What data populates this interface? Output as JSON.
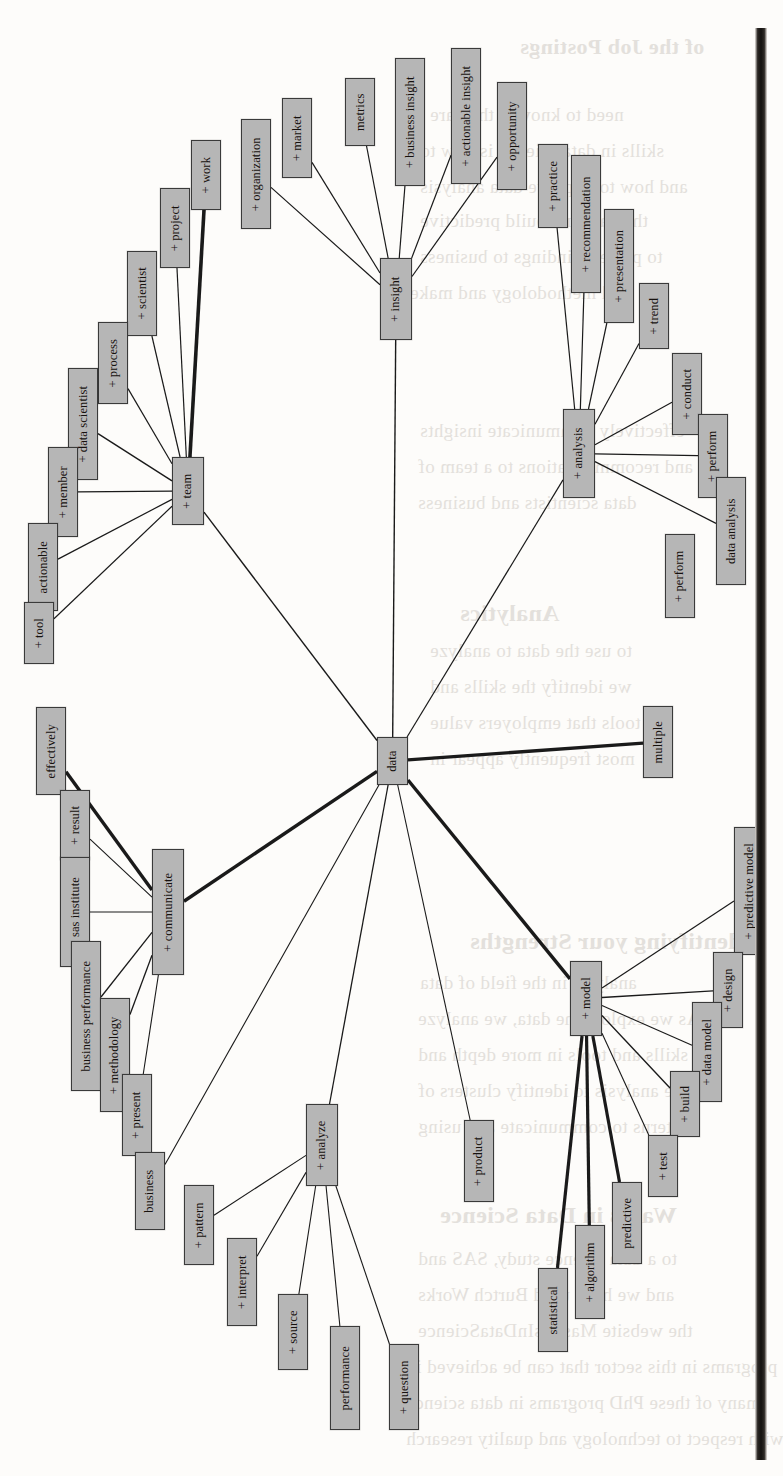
{
  "figure": {
    "type": "word-network-graph",
    "orientation": "rotated-90-ccw",
    "center_node": "data",
    "node_fill": "#b6b6b6",
    "node_stroke": "#3a3a3a",
    "edge_color": "#1a1a1a",
    "page_background": "#fdfcfa",
    "gutter_color": "#141210"
  },
  "nodes": [
    {
      "id": "data",
      "label": "data",
      "x": 377,
      "y": 737,
      "w": 31,
      "h": 48,
      "hub": true
    },
    {
      "id": "team",
      "label": "+ team",
      "x": 172,
      "y": 457,
      "w": 32,
      "h": 68,
      "hub": true
    },
    {
      "id": "insight",
      "label": "+ insight",
      "x": 380,
      "y": 258,
      "w": 32,
      "h": 82,
      "hub": true
    },
    {
      "id": "analysis",
      "label": "+ analysis",
      "x": 563,
      "y": 409,
      "w": 32,
      "h": 89,
      "hub": true
    },
    {
      "id": "communicate",
      "label": "+ communicate",
      "x": 152,
      "y": 849,
      "w": 32,
      "h": 126,
      "hub": true
    },
    {
      "id": "model",
      "label": "+ model",
      "x": 570,
      "y": 961,
      "w": 32,
      "h": 75,
      "hub": true
    },
    {
      "id": "analyze",
      "label": "+ analyze",
      "x": 306,
      "y": 1104,
      "w": 32,
      "h": 82,
      "hub": true
    },
    {
      "id": "work",
      "label": "+ work",
      "x": 191,
      "y": 140,
      "w": 30,
      "h": 70
    },
    {
      "id": "project",
      "label": "+ project",
      "x": 160,
      "y": 188,
      "w": 30,
      "h": 80
    },
    {
      "id": "scientist",
      "label": "+ scientist",
      "x": 127,
      "y": 251,
      "w": 30,
      "h": 85
    },
    {
      "id": "process",
      "label": "+ process",
      "x": 98,
      "y": 322,
      "w": 30,
      "h": 82
    },
    {
      "id": "data scientist",
      "label": "+ data scientist",
      "x": 68,
      "y": 368,
      "w": 30,
      "h": 112
    },
    {
      "id": "member",
      "label": "+ member",
      "x": 48,
      "y": 447,
      "w": 30,
      "h": 90
    },
    {
      "id": "actionable",
      "label": "actionable",
      "x": 28,
      "y": 523,
      "w": 30,
      "h": 88
    },
    {
      "id": "tool",
      "label": "+ tool",
      "x": 24,
      "y": 602,
      "w": 30,
      "h": 62
    },
    {
      "id": "organization",
      "label": "+ organization",
      "x": 241,
      "y": 119,
      "w": 30,
      "h": 110
    },
    {
      "id": "market",
      "label": "+ market",
      "x": 282,
      "y": 98,
      "w": 30,
      "h": 80
    },
    {
      "id": "metrics",
      "label": "metrics",
      "x": 345,
      "y": 78,
      "w": 30,
      "h": 68
    },
    {
      "id": "business insight",
      "label": "+ business insight",
      "x": 395,
      "y": 58,
      "w": 30,
      "h": 128
    },
    {
      "id": "actionable insight",
      "label": "+ actionable insight",
      "x": 451,
      "y": 48,
      "w": 30,
      "h": 136
    },
    {
      "id": "opportunity",
      "label": "+ opportunity",
      "x": 497,
      "y": 82,
      "w": 30,
      "h": 108
    },
    {
      "id": "practice",
      "label": "+ practice",
      "x": 538,
      "y": 144,
      "w": 30,
      "h": 84
    },
    {
      "id": "recommendation",
      "label": "+ recommendation",
      "x": 571,
      "y": 155,
      "w": 30,
      "h": 138
    },
    {
      "id": "presentation",
      "label": "+ presentation",
      "x": 604,
      "y": 209,
      "w": 30,
      "h": 114
    },
    {
      "id": "trend",
      "label": "+ trend",
      "x": 639,
      "y": 283,
      "w": 30,
      "h": 66
    },
    {
      "id": "conduct",
      "label": "+ conduct",
      "x": 672,
      "y": 353,
      "w": 30,
      "h": 82
    },
    {
      "id": "perform",
      "label": "+ perform",
      "x": 698,
      "y": 414,
      "w": 30,
      "h": 84
    },
    {
      "id": "data analysis",
      "label": "data analysis",
      "x": 716,
      "y": 477,
      "w": 30,
      "h": 108
    },
    {
      "id": "perform2",
      "label": "+ perform",
      "x": 665,
      "y": 534,
      "w": 30,
      "h": 84
    },
    {
      "id": "effectively",
      "label": "effectively",
      "x": 36,
      "y": 707,
      "w": 30,
      "h": 88
    },
    {
      "id": "result",
      "label": "+ result",
      "x": 60,
      "y": 790,
      "w": 30,
      "h": 70
    },
    {
      "id": "sas institute",
      "label": "+ sas institute",
      "x": 60,
      "y": 857,
      "w": 30,
      "h": 110
    },
    {
      "id": "business performance",
      "label": "business performance",
      "x": 71,
      "y": 941,
      "w": 30,
      "h": 150
    },
    {
      "id": "methodology",
      "label": "+ methodology",
      "x": 100,
      "y": 998,
      "w": 30,
      "h": 114
    },
    {
      "id": "present",
      "label": "+ present",
      "x": 122,
      "y": 1074,
      "w": 30,
      "h": 82
    },
    {
      "id": "business",
      "label": "business",
      "x": 135,
      "y": 1152,
      "w": 30,
      "h": 78
    },
    {
      "id": "multiple",
      "label": "multiple",
      "x": 643,
      "y": 706,
      "w": 30,
      "h": 72
    },
    {
      "id": "predictive model",
      "label": "+ predictive model",
      "x": 734,
      "y": 827,
      "w": 30,
      "h": 128
    },
    {
      "id": "design",
      "label": "+ design",
      "x": 713,
      "y": 952,
      "w": 30,
      "h": 76
    },
    {
      "id": "data model",
      "label": "+ data model",
      "x": 692,
      "y": 1002,
      "w": 30,
      "h": 100
    },
    {
      "id": "build",
      "label": "+ build",
      "x": 670,
      "y": 1071,
      "w": 30,
      "h": 66
    },
    {
      "id": "test",
      "label": "+ test",
      "x": 648,
      "y": 1135,
      "w": 30,
      "h": 62
    },
    {
      "id": "predictive",
      "label": "predictive",
      "x": 612,
      "y": 1182,
      "w": 30,
      "h": 82
    },
    {
      "id": "algorithm",
      "label": "+ algorithm",
      "x": 575,
      "y": 1225,
      "w": 30,
      "h": 94
    },
    {
      "id": "statistical",
      "label": "statistical",
      "x": 538,
      "y": 1268,
      "w": 30,
      "h": 84
    },
    {
      "id": "pattern",
      "label": "+ pattern",
      "x": 184,
      "y": 1185,
      "w": 30,
      "h": 80
    },
    {
      "id": "interpret",
      "label": "+ interpret",
      "x": 227,
      "y": 1238,
      "w": 30,
      "h": 88
    },
    {
      "id": "source",
      "label": "+ source",
      "x": 278,
      "y": 1294,
      "w": 30,
      "h": 76
    },
    {
      "id": "performance",
      "label": "performance",
      "x": 330,
      "y": 1326,
      "w": 30,
      "h": 104
    },
    {
      "id": "question",
      "label": "+ question",
      "x": 389,
      "y": 1344,
      "w": 30,
      "h": 86
    },
    {
      "id": "product",
      "label": "+ product",
      "x": 464,
      "y": 1120,
      "w": 30,
      "h": 82
    }
  ],
  "edges": [
    {
      "from": "data",
      "to": "team",
      "w": 1.4
    },
    {
      "from": "data",
      "to": "insight",
      "w": 1.4
    },
    {
      "from": "data",
      "to": "analysis",
      "w": 1.2
    },
    {
      "from": "data",
      "to": "communicate",
      "w": 3.4
    },
    {
      "from": "data",
      "to": "model",
      "w": 3.4
    },
    {
      "from": "data",
      "to": "analyze",
      "w": 1.3
    },
    {
      "from": "data",
      "to": "multiple",
      "w": 3.4
    },
    {
      "from": "data",
      "to": "product",
      "w": 1.1
    },
    {
      "from": "data",
      "to": "business",
      "w": 1.1
    },
    {
      "from": "team",
      "to": "work",
      "w": 3.6
    },
    {
      "from": "team",
      "to": "project",
      "w": 1.2
    },
    {
      "from": "team",
      "to": "scientist",
      "w": 1.2
    },
    {
      "from": "team",
      "to": "process",
      "w": 1.2
    },
    {
      "from": "team",
      "to": "data scientist",
      "w": 1.4
    },
    {
      "from": "team",
      "to": "member",
      "w": 1.2
    },
    {
      "from": "team",
      "to": "actionable",
      "w": 1.2
    },
    {
      "from": "team",
      "to": "tool",
      "w": 1.2
    },
    {
      "from": "insight",
      "to": "organization",
      "w": 1.2
    },
    {
      "from": "insight",
      "to": "market",
      "w": 1.2
    },
    {
      "from": "insight",
      "to": "metrics",
      "w": 1.2
    },
    {
      "from": "insight",
      "to": "business insight",
      "w": 1.2
    },
    {
      "from": "insight",
      "to": "actionable insight",
      "w": 1.2
    },
    {
      "from": "insight",
      "to": "opportunity",
      "w": 1.2
    },
    {
      "from": "analysis",
      "to": "practice",
      "w": 1.2
    },
    {
      "from": "analysis",
      "to": "recommendation",
      "w": 1.2
    },
    {
      "from": "analysis",
      "to": "presentation",
      "w": 1.2
    },
    {
      "from": "analysis",
      "to": "trend",
      "w": 1.2
    },
    {
      "from": "analysis",
      "to": "conduct",
      "w": 1.2
    },
    {
      "from": "analysis",
      "to": "perform",
      "w": 1.2
    },
    {
      "from": "analysis",
      "to": "data analysis",
      "w": 1.2
    },
    {
      "from": "communicate",
      "to": "effectively",
      "w": 3.4
    },
    {
      "from": "communicate",
      "to": "result",
      "w": 1.1
    },
    {
      "from": "communicate",
      "to": "sas institute",
      "w": 1.1
    },
    {
      "from": "communicate",
      "to": "business performance",
      "w": 1.3
    },
    {
      "from": "communicate",
      "to": "methodology",
      "w": 1.3
    },
    {
      "from": "communicate",
      "to": "present",
      "w": 1.1
    },
    {
      "from": "model",
      "to": "predictive model",
      "w": 1.2
    },
    {
      "from": "model",
      "to": "design",
      "w": 1.4
    },
    {
      "from": "model",
      "to": "data model",
      "w": 1.1
    },
    {
      "from": "model",
      "to": "build",
      "w": 1.4
    },
    {
      "from": "model",
      "to": "test",
      "w": 1.1
    },
    {
      "from": "model",
      "to": "predictive",
      "w": 3.2
    },
    {
      "from": "model",
      "to": "algorithm",
      "w": 3.2
    },
    {
      "from": "model",
      "to": "statistical",
      "w": 3.2
    },
    {
      "from": "analyze",
      "to": "pattern",
      "w": 1.1
    },
    {
      "from": "analyze",
      "to": "interpret",
      "w": 1.1
    },
    {
      "from": "analyze",
      "to": "source",
      "w": 1.1
    },
    {
      "from": "analyze",
      "to": "performance",
      "w": 1.1
    },
    {
      "from": "analyze",
      "to": "question",
      "w": 1.1
    }
  ],
  "background_text": [
    {
      "text": "of the Job Postings",
      "x": 520,
      "y": 34,
      "size": 22,
      "bold": true
    },
    {
      "text": "need to know if they are",
      "x": 430,
      "y": 104,
      "size": 19
    },
    {
      "text": "skills in data science is how to",
      "x": 420,
      "y": 140,
      "size": 19
    },
    {
      "text": "and how to improve data analysis",
      "x": 420,
      "y": 176,
      "size": 19
    },
    {
      "text": "the data and build predictive",
      "x": 420,
      "y": 210,
      "size": 19
    },
    {
      "text": "to present findings to business",
      "x": 420,
      "y": 246,
      "size": 19
    },
    {
      "text": "and methodology and make",
      "x": 410,
      "y": 282,
      "size": 19
    },
    {
      "text": "effectively communicate insights",
      "x": 420,
      "y": 420,
      "size": 19
    },
    {
      "text": "and recommendations to a team of",
      "x": 418,
      "y": 456,
      "size": 19
    },
    {
      "text": "data scientists and business",
      "x": 418,
      "y": 492,
      "size": 19
    },
    {
      "text": "Analytics",
      "x": 460,
      "y": 600,
      "size": 24,
      "bold": true
    },
    {
      "text": "to use the data to analyze",
      "x": 430,
      "y": 640,
      "size": 19
    },
    {
      "text": "we identify the skills and",
      "x": 430,
      "y": 676,
      "size": 19
    },
    {
      "text": "tools that employers value",
      "x": 430,
      "y": 712,
      "size": 19
    },
    {
      "text": "most frequently appear in",
      "x": 430,
      "y": 748,
      "size": 19
    },
    {
      "text": "Identifying your Strengths",
      "x": 470,
      "y": 928,
      "size": 24,
      "bold": true
    },
    {
      "text": "analysts in the field of data",
      "x": 420,
      "y": 972,
      "size": 19
    },
    {
      "text": "As we explore the data, we analyze",
      "x": 418,
      "y": 1008,
      "size": 19
    },
    {
      "text": "skills and tools in more depth and",
      "x": 418,
      "y": 1044,
      "size": 19
    },
    {
      "text": "the analysis to identify clusters of",
      "x": 418,
      "y": 1080,
      "size": 19
    },
    {
      "text": "patterns to communicate and using",
      "x": 418,
      "y": 1116,
      "size": 19
    },
    {
      "text": "Wants in Data Science",
      "x": 440,
      "y": 1202,
      "size": 24,
      "bold": true
    },
    {
      "text": "to a data science study, SAS and",
      "x": 418,
      "y": 1248,
      "size": 19
    },
    {
      "text": "and we have used Burtch Works",
      "x": 418,
      "y": 1284,
      "size": 19
    },
    {
      "text": "the website MastersInDataScience",
      "x": 418,
      "y": 1320,
      "size": 19
    },
    {
      "text": "programs in this sector that can be achieved in",
      "x": 406,
      "y": 1356,
      "size": 19
    },
    {
      "text": "many of these PhD programs in data science",
      "x": 406,
      "y": 1392,
      "size": 19
    },
    {
      "text": "with respect to technology and quality research",
      "x": 406,
      "y": 1428,
      "size": 19
    }
  ]
}
